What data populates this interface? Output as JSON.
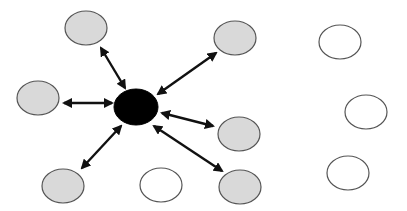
{
  "diagram": {
    "type": "hub-and-spoke network",
    "colors": {
      "hub": "#000000",
      "connected_node": "#d9d9d9",
      "unconnected_node": "#ffffff",
      "outline": "#555555",
      "arrow": "#111111"
    },
    "hub": {
      "id": "hub",
      "cx": 136,
      "cy": 107,
      "rx": 22,
      "ry": 18
    },
    "nodes": [
      {
        "id": "n1",
        "kind": "connected",
        "cx": 86,
        "cy": 28,
        "rx": 21,
        "ry": 17
      },
      {
        "id": "n2",
        "kind": "connected",
        "cx": 235,
        "cy": 38,
        "rx": 21,
        "ry": 17
      },
      {
        "id": "n3",
        "kind": "connected",
        "cx": 38,
        "cy": 98,
        "rx": 21,
        "ry": 17
      },
      {
        "id": "n4",
        "kind": "connected",
        "cx": 239,
        "cy": 134,
        "rx": 21,
        "ry": 17
      },
      {
        "id": "n5",
        "kind": "connected",
        "cx": 63,
        "cy": 186,
        "rx": 21,
        "ry": 17
      },
      {
        "id": "n6",
        "kind": "unconnected",
        "cx": 161,
        "cy": 185,
        "rx": 21,
        "ry": 17
      },
      {
        "id": "n7",
        "kind": "connected",
        "cx": 240,
        "cy": 187,
        "rx": 21,
        "ry": 17
      },
      {
        "id": "n8",
        "kind": "unconnected",
        "cx": 340,
        "cy": 42,
        "rx": 21,
        "ry": 17
      },
      {
        "id": "n9",
        "kind": "unconnected",
        "cx": 366,
        "cy": 112,
        "rx": 21,
        "ry": 17
      },
      {
        "id": "n10",
        "kind": "unconnected",
        "cx": 348,
        "cy": 173,
        "rx": 21,
        "ry": 17
      }
    ],
    "edges": [
      {
        "from": "hub",
        "to": "n1",
        "bidirectional": true,
        "x1": 125,
        "y1": 88,
        "x2": 101,
        "y2": 48
      },
      {
        "from": "hub",
        "to": "n2",
        "bidirectional": true,
        "x1": 158,
        "y1": 94,
        "x2": 216,
        "y2": 53
      },
      {
        "from": "hub",
        "to": "n3",
        "bidirectional": true,
        "x1": 112,
        "y1": 103,
        "x2": 64,
        "y2": 103
      },
      {
        "from": "hub",
        "to": "n4",
        "bidirectional": true,
        "x1": 162,
        "y1": 113,
        "x2": 213,
        "y2": 126
      },
      {
        "from": "hub",
        "to": "n5",
        "bidirectional": true,
        "x1": 121,
        "y1": 126,
        "x2": 82,
        "y2": 168
      },
      {
        "from": "hub",
        "to": "n7",
        "bidirectional": true,
        "x1": 154,
        "y1": 126,
        "x2": 222,
        "y2": 171
      }
    ]
  }
}
